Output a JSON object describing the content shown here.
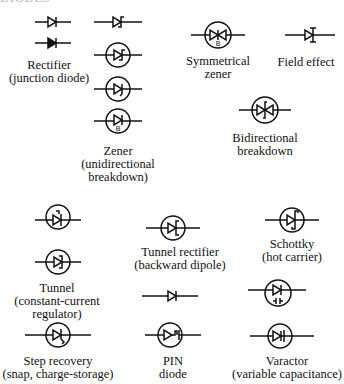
{
  "title": "DIODES",
  "symbols": [
    {
      "id": "rectifier",
      "label_lines": [
        "Rectifier",
        "(junction diode)"
      ]
    },
    {
      "id": "zener",
      "label_lines": [
        "Zener",
        "(unidirectional",
        "breakdown)"
      ],
      "variant_marks": [
        "B"
      ]
    },
    {
      "id": "symmetrical-zener",
      "label_lines": [
        "Symmetrical",
        "zener"
      ],
      "variant_marks": [
        "B"
      ]
    },
    {
      "id": "field-effect",
      "label_lines": [
        "Field effect"
      ]
    },
    {
      "id": "bidirectional-breakdown",
      "label_lines": [
        "Bidirectional",
        "breakdown"
      ]
    },
    {
      "id": "tunnel",
      "label_lines": [
        "Tunnel",
        "(constant-current",
        "regulator)"
      ]
    },
    {
      "id": "tunnel-rectifier",
      "label_lines": [
        "Tunnel rectifier",
        "(backward dipole)"
      ]
    },
    {
      "id": "schottky",
      "label_lines": [
        "Schottky",
        "(hot carrier)"
      ]
    },
    {
      "id": "step-recovery",
      "label_lines": [
        "Step recovery",
        "(snap, charge-storage)"
      ]
    },
    {
      "id": "pin-diode",
      "label_lines": [
        "PIN",
        "diode"
      ]
    },
    {
      "id": "varactor",
      "label_lines": [
        "Varactor",
        "(variable capacitance)"
      ]
    }
  ]
}
